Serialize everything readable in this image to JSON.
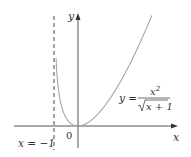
{
  "chart_data": {
    "type": "line",
    "title": "",
    "function": "y = x^2 / sqrt(x + 1)",
    "xlabel": "x",
    "ylabel": "y",
    "origin_label": "0",
    "asymptote": {
      "x": -1,
      "label": "x = −1",
      "style": "dashed"
    },
    "curve_label": {
      "lhs": "y =",
      "numerator": "x²",
      "denominator": "√x + 1"
    },
    "xlim": [
      -3.2,
      4.4
    ],
    "ylim": [
      -1.2,
      5.2
    ],
    "grid": false,
    "legend": "none",
    "series": [
      {
        "name": "y = x^2/sqrt(x+1)",
        "x": [
          -0.98,
          -0.95,
          -0.9,
          -0.8,
          -0.7,
          -0.6,
          -0.5,
          -0.4,
          -0.3,
          -0.2,
          -0.1,
          0,
          0.25,
          0.5,
          0.75,
          1,
          1.5,
          2,
          2.5,
          3.05
        ],
        "values": [
          6.79,
          4.04,
          2.56,
          1.43,
          0.89,
          0.57,
          0.35,
          0.21,
          0.11,
          0.04,
          0.01,
          0,
          0.056,
          0.204,
          0.425,
          0.707,
          1.423,
          2.309,
          3.341,
          4.62
        ]
      }
    ],
    "colors": {
      "curve": "#a0a0a0",
      "axes": "#555555",
      "asymptote": "#666666"
    }
  },
  "labels": {
    "y_axis": "y",
    "x_axis": "x",
    "origin": "0",
    "asymptote": "x = −1",
    "eq_lhs": "y =",
    "eq_num": "x",
    "eq_num_sup": "2",
    "eq_den": "x + 1"
  }
}
